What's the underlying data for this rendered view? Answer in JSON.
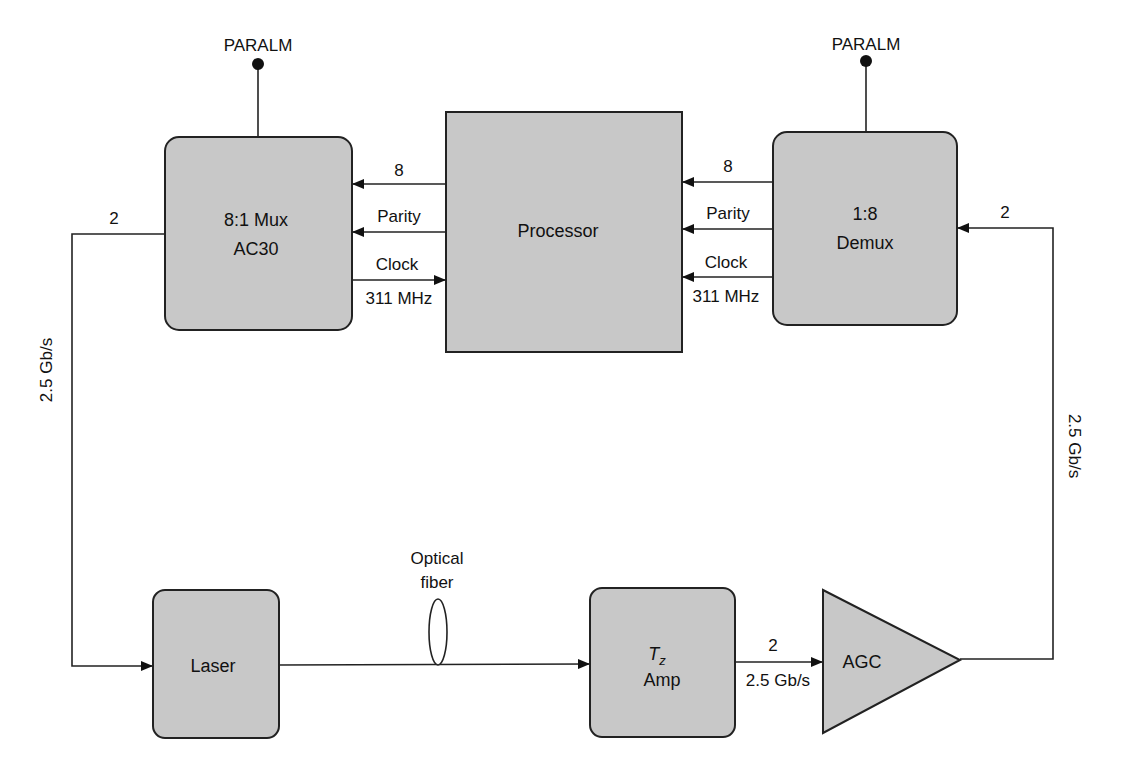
{
  "diagram": {
    "type": "block-diagram",
    "colors": {
      "block_fill": "#c8c8c8",
      "stroke": "#222222",
      "background": "#ffffff"
    },
    "blocks": {
      "mux": {
        "line1": "8:1 Mux",
        "line2": "AC30"
      },
      "processor": {
        "label": "Processor"
      },
      "demux": {
        "line1": "1:8",
        "line2": "Demux"
      },
      "laser": {
        "label": "Laser"
      },
      "tz_amp": {
        "line1_main": "T",
        "line1_sub": "z",
        "line2": "Amp"
      },
      "agc": {
        "label": "AGC"
      }
    },
    "terminals": {
      "mux_paralm": "PARALM",
      "demux_paralm": "PARALM"
    },
    "signals": {
      "proc_to_mux_data": "8",
      "proc_to_mux_parity": "Parity",
      "mux_to_proc_clock": "Clock",
      "mux_to_proc_clock_freq": "311 MHz",
      "demux_to_proc_data": "8",
      "demux_to_proc_parity": "Parity",
      "demux_to_proc_clock": "Clock",
      "demux_to_proc_clock_freq": "311 MHz",
      "mux_out_width": "2",
      "mux_out_rate": "2.5 Gb/s",
      "demux_in_width": "2",
      "demux_in_rate": "2.5 Gb/s",
      "fiber_label_1": "Optical",
      "fiber_label_2": "fiber",
      "amp_to_agc_width": "2",
      "amp_to_agc_rate": "2.5 Gb/s"
    }
  }
}
